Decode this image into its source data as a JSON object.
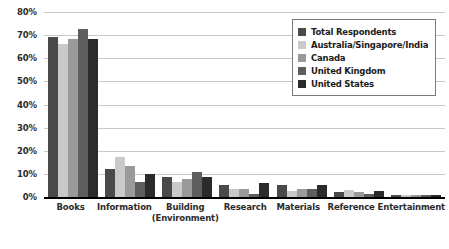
{
  "chart_data": {
    "type": "bar",
    "title": "",
    "subtitle": "",
    "xlabel": "",
    "ylabel": "",
    "ylim": [
      0,
      80
    ],
    "ytick_labels": [
      "0%",
      "10%",
      "20%",
      "30%",
      "40%",
      "50%",
      "60%",
      "70%",
      "80%"
    ],
    "ytick_values": [
      0,
      10,
      20,
      30,
      40,
      50,
      60,
      70,
      80
    ],
    "grid": true,
    "legend_position": "top-right",
    "categories": [
      "Books",
      "Information",
      "Building",
      "Research",
      "Materials",
      "Reference",
      "Entertainment"
    ],
    "category_sublabels": [
      "",
      "",
      "(Environment)",
      "",
      "",
      "",
      ""
    ],
    "series": [
      {
        "name": "Total Respondents",
        "color": "#4a4a4a",
        "values": [
          69,
          12,
          8.5,
          5,
          5,
          2,
          1
        ]
      },
      {
        "name": "Australia/Singapore/India",
        "color": "#c9c9c9",
        "values": [
          66,
          17.5,
          6.5,
          3.5,
          2.5,
          3,
          1
        ]
      },
      {
        "name": "Canada",
        "color": "#9a9a9a",
        "values": [
          68.5,
          13.5,
          8,
          3.5,
          3.5,
          2,
          1
        ]
      },
      {
        "name": "United Kingdom",
        "color": "#5e5e5e",
        "values": [
          72.5,
          6.5,
          11,
          1.5,
          3.5,
          1.5,
          1
        ]
      },
      {
        "name": "United States",
        "color": "#2b2b2b",
        "values": [
          68.5,
          10,
          8.5,
          6,
          5,
          2.5,
          1
        ]
      }
    ]
  }
}
